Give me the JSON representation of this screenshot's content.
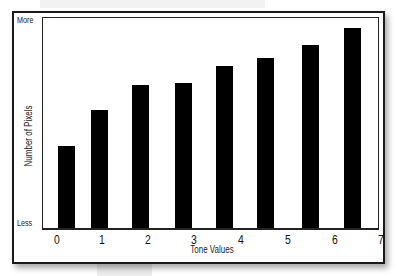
{
  "chart_data": {
    "type": "bar",
    "title": "",
    "xlabel": "Tone Values",
    "ylabel": "Number of Pixels",
    "y_tick_labels": {
      "top": "More",
      "bottom": "Less"
    },
    "x_tick_labels": [
      "0",
      "1",
      "2",
      "3",
      "4",
      "5",
      "6",
      "7"
    ],
    "categories": [
      "0",
      "1",
      "2",
      "3",
      "4",
      "5",
      "6",
      "7"
    ],
    "values": [
      39,
      56,
      68,
      69,
      77,
      81,
      87,
      95
    ],
    "value_scale": "relative (0 = Less, 100 = More)",
    "ylim": [
      0,
      100
    ],
    "grid": false,
    "legend": null,
    "bar_color": "#000000"
  },
  "labels": {
    "more": "More",
    "less": "Less",
    "y_title": "Number of Pixels",
    "x_title": "Tone Values",
    "ticks": [
      "0",
      "1",
      "2",
      "3",
      "4",
      "5",
      "6",
      "7"
    ]
  }
}
